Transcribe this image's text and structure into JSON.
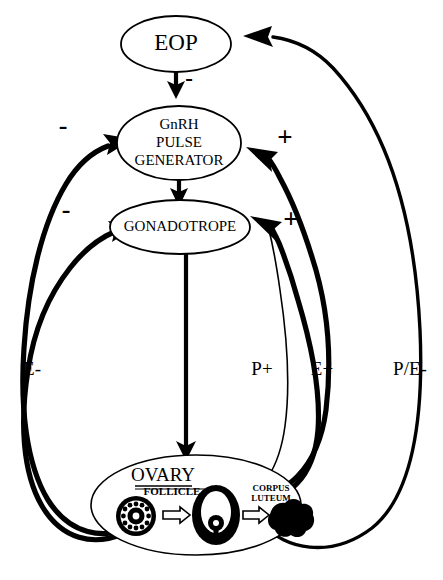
{
  "diagram": {
    "nodes": [
      {
        "id": "eop",
        "label": "EOP",
        "shape": "ellipse"
      },
      {
        "id": "gnrh",
        "label_line1": "GnRH",
        "label_line2": "PULSE",
        "label_line3": "GENERATOR",
        "shape": "ellipse"
      },
      {
        "id": "gonadotrope",
        "label": "GONADOTROPE",
        "shape": "ellipse"
      },
      {
        "id": "ovary",
        "label": "OVARY",
        "shape": "ellipse"
      }
    ],
    "ovary_parts": {
      "follicle_label": "FOLLICLE",
      "corpus_luteum_line1": "CORPUS",
      "corpus_luteum_line2": "LUTEUM"
    },
    "signs": {
      "eop_to_gnrh": "-",
      "left_upper_to_gnrh": "-",
      "left_lower_to_gonadotrope": "-",
      "right_to_gnrh": "+",
      "right_to_gonadotrope": "+"
    },
    "path_labels": {
      "left": "E-",
      "middle_right": "P+",
      "right": "E+",
      "far_right": "P/E-"
    },
    "colors": {
      "stroke": "#000000",
      "background": "#ffffff",
      "fill": "#ffffff"
    }
  }
}
